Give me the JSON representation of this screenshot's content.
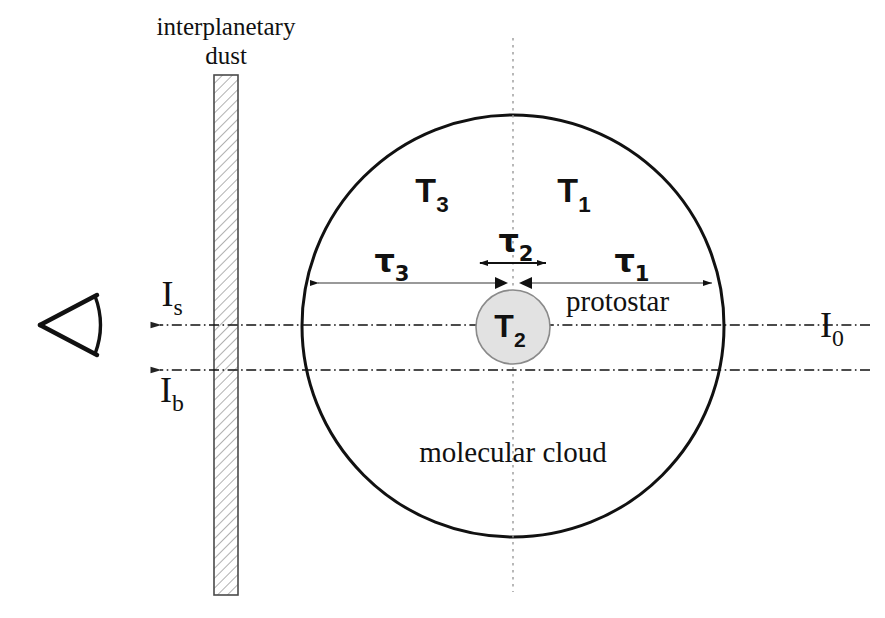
{
  "figure": {
    "background_color": "#ffffff",
    "ink_color": "#111111",
    "thin_line_color": "#555555",
    "protostar_fill": "#e2e2e2",
    "protostar_stroke": "#8a8a8a",
    "hatch_color": "#6f6f6f"
  },
  "labels": {
    "interplanetary_dust_line1": "interplanetary",
    "interplanetary_dust_line2": "dust",
    "molecular_cloud": "molecular cloud",
    "protostar": "protostar"
  },
  "intensities": [
    {
      "id": "I_s",
      "base": "I",
      "subscript": "s",
      "x": 172,
      "y": 305,
      "direction": "left"
    },
    {
      "id": "I_b",
      "base": "I",
      "subscript": "b",
      "x": 172,
      "y": 400,
      "direction": "left"
    },
    {
      "id": "I_0",
      "base": "I",
      "subscript": "0",
      "x": 832,
      "y": 325,
      "direction": "incoming"
    }
  ],
  "temperatures": [
    {
      "id": "T_3",
      "base": "T",
      "subscript": "3",
      "x": 432,
      "y": 200
    },
    {
      "id": "T_1",
      "base": "T",
      "subscript": "1",
      "x": 572,
      "y": 200
    },
    {
      "id": "T_2",
      "base": "T",
      "subscript": "2",
      "x": 513,
      "y": 340
    }
  ],
  "optical_depths": [
    {
      "id": "tau_3",
      "base": "τ",
      "subscript": "3",
      "x": 390,
      "y": 272,
      "span_from": 318,
      "span_to": 500
    },
    {
      "id": "tau_2",
      "base": "τ",
      "subscript": "2",
      "x": 513,
      "y": 250,
      "span_from": 477,
      "span_to": 549
    },
    {
      "id": "tau_1",
      "base": "τ",
      "subscript": "1",
      "x": 630,
      "y": 272,
      "span_from": 527,
      "span_to": 712
    }
  ],
  "geometry": {
    "cloud_circle": {
      "cx": 513,
      "cy": 326,
      "r": 211
    },
    "protostar_circle": {
      "cx": 513,
      "cy": 327,
      "r": 37
    },
    "dust_slab": {
      "x": 214,
      "y": 75,
      "width": 24,
      "height": 520
    },
    "center_axis_x": 513,
    "sightline_upper_y": 325,
    "sightline_lower_y": 370,
    "eye": {
      "apex_x": 40,
      "apex_y": 325,
      "open_x": 97
    }
  },
  "icons": {
    "eye": "eye-icon",
    "arrow_left": "arrow-left-icon",
    "arrow_right": "arrow-right-icon"
  }
}
